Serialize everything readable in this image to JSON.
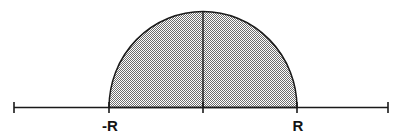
{
  "figure": {
    "background_color": "#ffffff",
    "stroke_color": "#1a1a1a",
    "fill_pattern": "checkerboard-dither-50",
    "fill_color_a": "#ffffff",
    "fill_color_b": "#6e6e6e",
    "width": 401,
    "height": 140
  },
  "axis": {
    "name": "horizontal-number-line",
    "y": 107.5,
    "x_start": 14,
    "x_end": 388,
    "line_width": 1.6,
    "tick_length": 11,
    "ticks": [
      {
        "name": "left-end-tick",
        "x": 14,
        "label": ""
      },
      {
        "name": "neg-r-tick",
        "x": 109,
        "label": "-R"
      },
      {
        "name": "origin-tick",
        "x": 203,
        "label": ""
      },
      {
        "name": "pos-r-tick",
        "x": 297,
        "label": "R"
      },
      {
        "name": "right-end-tick",
        "x": 388,
        "label": ""
      }
    ]
  },
  "labels": {
    "neg_r": "-R",
    "pos_r": "R"
  },
  "semicircle": {
    "name": "shaded-semicircle",
    "center_x": 203,
    "base_y": 107.5,
    "radius_x": 94,
    "radius_y": 96,
    "left_x": 109,
    "right_x": 297,
    "apex_y": 11.5,
    "stroke_width": 1.5
  },
  "center_line": {
    "name": "vertical-radius-line",
    "x": 203,
    "y_top": 11.5,
    "y_bottom": 107.5,
    "stroke_width": 1.4
  }
}
